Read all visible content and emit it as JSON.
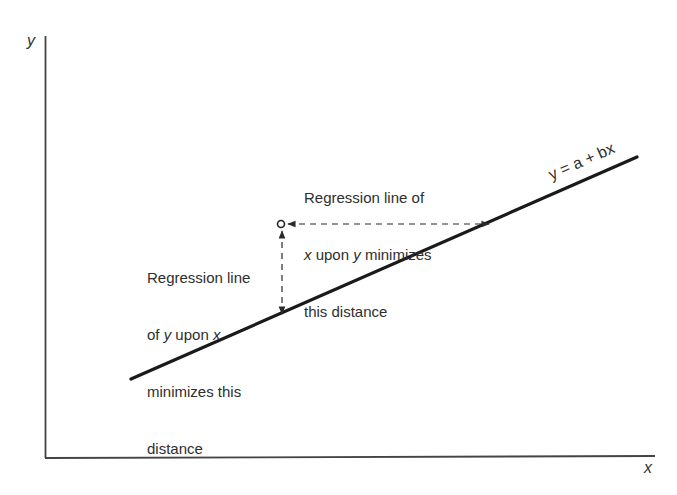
{
  "axes": {
    "x_label": "x",
    "y_label": "y"
  },
  "regression_line": {
    "equation": "y = a + bx",
    "start": [
      131,
      379
    ],
    "end": [
      637,
      157
    ]
  },
  "data_point": {
    "position": [
      281,
      224
    ]
  },
  "annotations": {
    "x_upon_y": {
      "line1": "Regression line of",
      "line2_var": "x",
      "line2_rest": " upon ",
      "line2_var2": "y",
      "line2_end": " minimizes",
      "line3": "this distance"
    },
    "y_upon_x": {
      "line1": "Regression line",
      "line2_pre": "of ",
      "line2_var": "y",
      "line2_mid": " upon ",
      "line2_var2": "x",
      "line3": "minimizes this",
      "line4": "distance"
    }
  },
  "colors": {
    "line": "#1a1a1a",
    "axis": "#444444",
    "text": "#2e2e2e"
  }
}
